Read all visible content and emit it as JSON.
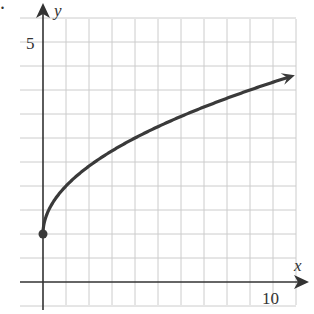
{
  "chart_data": {
    "type": "line",
    "title": "",
    "function": "y = 1 + sqrt(x)",
    "xlabel": "x",
    "ylabel": "y",
    "x_tick_labels": [
      {
        "value": 10,
        "label": "10"
      }
    ],
    "y_tick_labels": [
      {
        "value": 5,
        "label": "5"
      }
    ],
    "xlim": [
      0,
      11
    ],
    "ylim": [
      0,
      5.5
    ],
    "grid": true,
    "grid_x_step": 1,
    "grid_y_step": 0.5,
    "series": [
      {
        "name": "curve",
        "x": [
          0,
          0.25,
          1,
          2,
          3,
          4,
          5,
          6,
          7,
          8,
          9,
          10,
          10.9
        ],
        "y": [
          1,
          1.5,
          2,
          2.41,
          2.73,
          3,
          3.24,
          3.45,
          3.65,
          3.83,
          4,
          4.16,
          4.3
        ],
        "start_point": {
          "x": 0,
          "y": 1,
          "marker": "filled-circle"
        },
        "end": "arrow"
      }
    ],
    "colors": {
      "curve": "#3a3a3a",
      "grid": "#cccccc",
      "axes": "#333333"
    }
  },
  "labels": {
    "x_axis": "x",
    "y_axis": "y",
    "x_tick_10": "10",
    "y_tick_5": "5",
    "corner_mark": "."
  }
}
